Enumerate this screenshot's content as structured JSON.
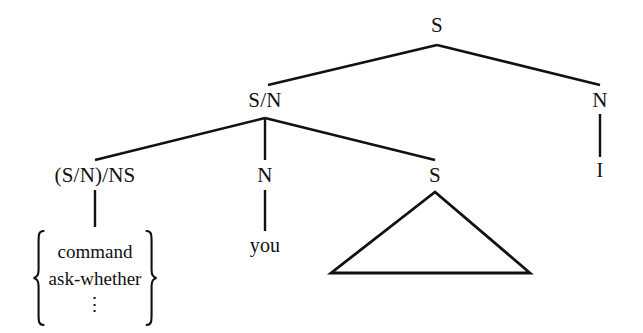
{
  "figure": {
    "type": "syntactic-tree-diagram",
    "background_color": "#ffffff",
    "ink_color": "#111111",
    "nodes": {
      "root_s": "S",
      "s_over_n": "S/N",
      "right_n": "N",
      "right_n_terminal": "I",
      "functor": "(S/N)/NS",
      "middle_n": "N",
      "middle_n_terminal": "you",
      "embedded_s": "S"
    },
    "lexical_set": {
      "open_delimiter": "left-curly-brace",
      "close_delimiter": "right-curly-brace",
      "items": [
        "command",
        "ask-whether"
      ],
      "continuation": "⋮"
    },
    "abbreviation_triangle": {
      "label": "elided-subtree-triangle",
      "apex_x": 435,
      "apex_y": 192,
      "base_left_x": 331,
      "base_right_x": 530,
      "base_y": 273
    },
    "edges": [
      {
        "name": "edge-root-s-to-s-over-n",
        "x1": 437,
        "y1": 45,
        "x2": 268,
        "y2": 85
      },
      {
        "name": "edge-root-s-to-right-n",
        "x1": 437,
        "y1": 45,
        "x2": 600,
        "y2": 85
      },
      {
        "name": "edge-right-n-to-i",
        "x1": 600,
        "y1": 114,
        "x2": 600,
        "y2": 157
      },
      {
        "name": "edge-s-over-n-to-functor",
        "x1": 265,
        "y1": 118,
        "x2": 95,
        "y2": 160
      },
      {
        "name": "edge-s-over-n-to-middle-n",
        "x1": 265,
        "y1": 118,
        "x2": 265,
        "y2": 160
      },
      {
        "name": "edge-s-over-n-to-embedded-s",
        "x1": 265,
        "y1": 118,
        "x2": 435,
        "y2": 160
      },
      {
        "name": "edge-functor-to-lexical-set",
        "x1": 95,
        "y1": 189,
        "x2": 95,
        "y2": 226
      },
      {
        "name": "edge-middle-n-to-you",
        "x1": 265,
        "y1": 189,
        "x2": 265,
        "y2": 231
      }
    ]
  }
}
